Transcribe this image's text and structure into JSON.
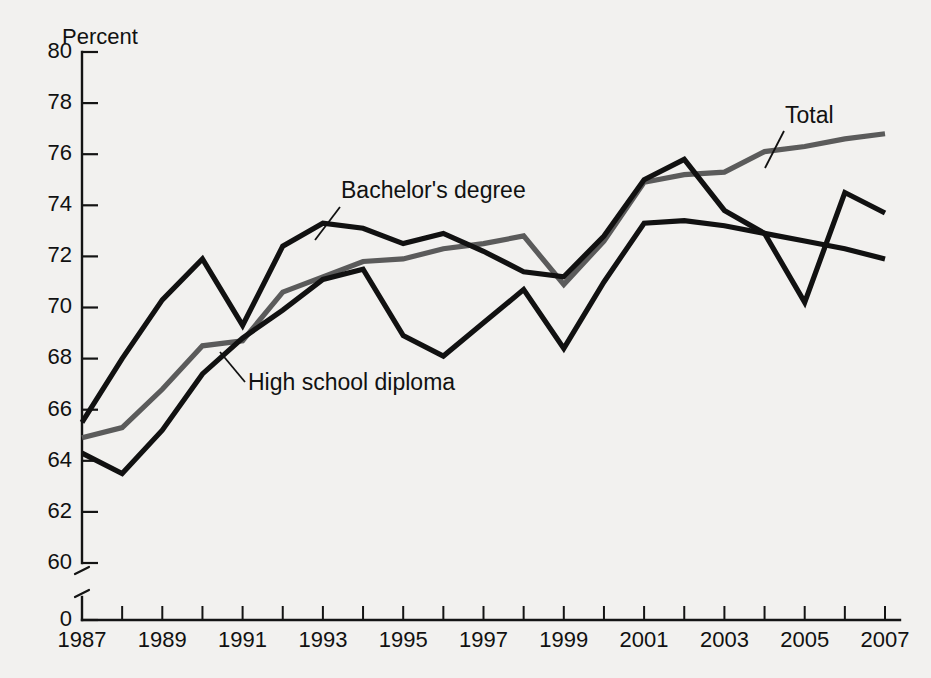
{
  "chart_data": {
    "type": "line",
    "title": "",
    "xlabel": "",
    "ylabel": "Percent",
    "ylim": [
      60,
      80
    ],
    "xlim": [
      1987,
      2007
    ],
    "grid": false,
    "legend_position": "inline-annotations",
    "y_axis_break": true,
    "y_axis_break_note": "axis broken between 0 and 60",
    "yticks": [
      80,
      78,
      76,
      74,
      72,
      70,
      68,
      66,
      64,
      62,
      60,
      0
    ],
    "ytick_labels": [
      "80",
      "78",
      "76",
      "74",
      "72",
      "70",
      "68",
      "66",
      "64",
      "62",
      "60",
      "0"
    ],
    "x": [
      1987,
      1988,
      1989,
      1990,
      1991,
      1992,
      1993,
      1994,
      1995,
      1996,
      1997,
      1998,
      1999,
      2000,
      2001,
      2002,
      2003,
      2004,
      2005,
      2006,
      2007
    ],
    "xticks": [
      1987,
      1988,
      1989,
      1990,
      1991,
      1992,
      1993,
      1994,
      1995,
      1996,
      1997,
      1998,
      1999,
      2000,
      2001,
      2002,
      2003,
      2004,
      2005,
      2006,
      2007
    ],
    "xtick_labels": [
      "1987",
      "",
      "1989",
      "",
      "1991",
      "",
      "1993",
      "",
      "1995",
      "",
      "1997",
      "",
      "1999",
      "",
      "2001",
      "",
      "2003",
      "",
      "2005",
      "",
      "2007"
    ],
    "series": [
      {
        "name": "Total",
        "color": "#5b5b5b",
        "values": [
          64.9,
          65.3,
          66.8,
          68.5,
          68.7,
          70.6,
          71.2,
          71.8,
          71.9,
          72.3,
          72.5,
          72.8,
          70.9,
          72.6,
          74.9,
          75.2,
          75.3,
          76.1,
          76.3,
          76.6,
          76.8
        ]
      },
      {
        "name": "High school diploma",
        "color": "#111111",
        "values": [
          64.3,
          63.5,
          65.2,
          67.4,
          68.8,
          69.9,
          71.1,
          71.5,
          68.9,
          68.1,
          69.4,
          70.7,
          68.4,
          71.0,
          73.3,
          73.4,
          73.2,
          72.9,
          72.6,
          72.3,
          71.9
        ]
      },
      {
        "name": "Bachelor's degree",
        "color": "#111111",
        "values": [
          65.5,
          68.0,
          70.3,
          71.9,
          69.3,
          72.4,
          73.3,
          73.1,
          72.5,
          72.9,
          72.2,
          71.4,
          71.2,
          72.8,
          75.0,
          75.8,
          73.8,
          72.9,
          70.2,
          74.5,
          73.7
        ]
      }
    ],
    "annotations": [
      {
        "text": "Bachelor's degree",
        "series": "Bachelor's degree",
        "label_x": 341,
        "label_y": 198,
        "leader_from_x": 340,
        "leader_from_y": 207,
        "leader_to_x": 315,
        "leader_to_y": 240
      },
      {
        "text": "High school diploma",
        "series": "High school diploma",
        "label_x": 248,
        "label_y": 390,
        "leader_from_x": 245,
        "leader_from_y": 382,
        "leader_to_x": 220,
        "leader_to_y": 352
      },
      {
        "text": "Total",
        "series": "Total",
        "label_x": 785,
        "label_y": 123,
        "leader_from_x": 784,
        "leader_from_y": 131,
        "leader_to_x": 765,
        "leader_to_y": 168
      }
    ]
  }
}
